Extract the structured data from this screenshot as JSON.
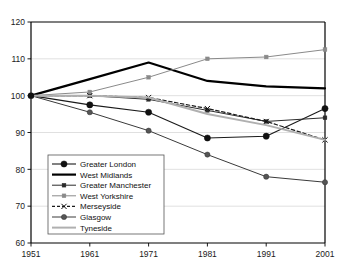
{
  "chart_data": {
    "type": "line",
    "title": "",
    "xlabel": "",
    "ylabel": "",
    "x": [
      1951,
      1961,
      1971,
      1981,
      1991,
      2001
    ],
    "xtick_labels": [
      "1951",
      "1961",
      "1971",
      "1981",
      "1991",
      "2001"
    ],
    "ytick_labels": [
      "60",
      "70",
      "80",
      "90",
      "100",
      "110",
      "120"
    ],
    "yticks": [
      60,
      70,
      80,
      90,
      100,
      110,
      120
    ],
    "ylim": [
      60,
      120
    ],
    "xlim": [
      1951,
      2001
    ],
    "grid": true,
    "legend_position": "lower-left-inside",
    "series": [
      {
        "name": "Greater London",
        "values": [
          100,
          97.5,
          95.5,
          88.5,
          89,
          96.5
        ],
        "color": "#1a1a1a",
        "marker": "circle-large",
        "dash": "none",
        "width": 1.1
      },
      {
        "name": "West Midlands",
        "values": [
          100,
          104.5,
          109,
          104,
          102.5,
          102
        ],
        "color": "#000000",
        "marker": "none",
        "dash": "none",
        "width": 2.2
      },
      {
        "name": "Greater Manchester",
        "values": [
          100,
          100,
          99,
          96,
          93,
          94
        ],
        "color": "#2b2b2b",
        "marker": "square-small",
        "dash": "none",
        "width": 1.0
      },
      {
        "name": "West Yorkshire",
        "values": [
          100,
          101,
          105,
          110,
          110.5,
          112.5
        ],
        "color": "#8a8a8a",
        "marker": "square-small",
        "dash": "none",
        "width": 1.0
      },
      {
        "name": "Merseyside",
        "values": [
          100,
          100,
          99.5,
          96.5,
          93,
          88
        ],
        "color": "#1a1a1a",
        "marker": "cross",
        "dash": "dashed",
        "width": 1.2
      },
      {
        "name": "Glasgow",
        "values": [
          100,
          95.5,
          90.5,
          84,
          78,
          76.5
        ],
        "color": "#3a3a3a",
        "marker": "circle-gray",
        "dash": "none",
        "width": 1.0
      },
      {
        "name": "Tyneside",
        "values": [
          100,
          100,
          99.5,
          95,
          92,
          88
        ],
        "color": "#b0b0b0",
        "marker": "none",
        "dash": "none",
        "width": 2.0
      }
    ]
  },
  "legend": {
    "entries": [
      {
        "label": "Greater London"
      },
      {
        "label": "West Midlands"
      },
      {
        "label": "Greater Manchester"
      },
      {
        "label": "West Yorkshire"
      },
      {
        "label": "Merseyside"
      },
      {
        "label": "Glasgow"
      },
      {
        "label": "Tyneside"
      }
    ]
  },
  "colors": {
    "axis": "#000000",
    "grid": "#d8d8d8",
    "background": "#ffffff"
  }
}
